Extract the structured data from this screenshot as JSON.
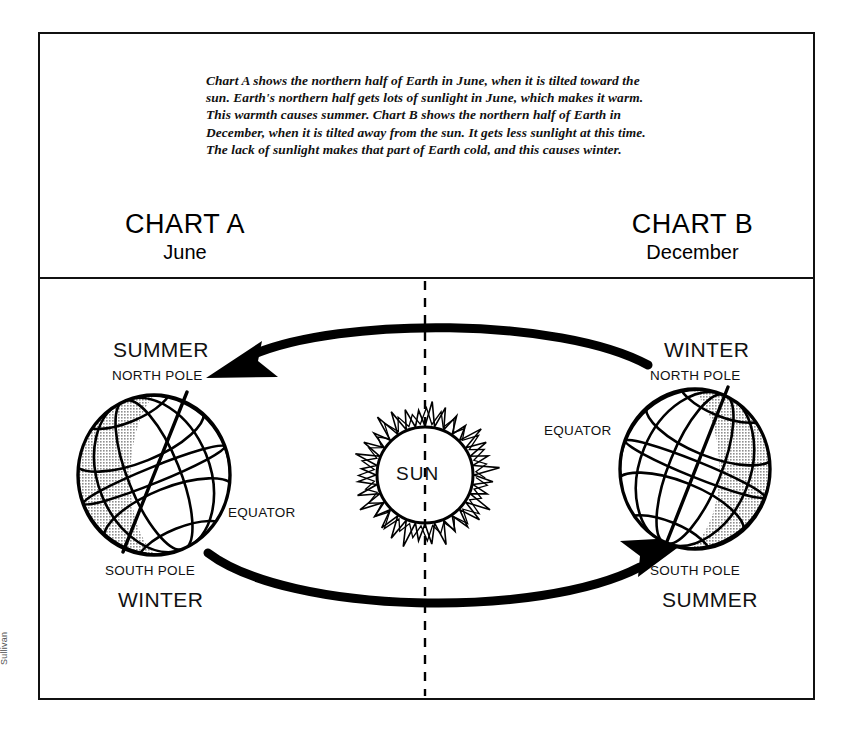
{
  "page": {
    "credit": "Sullivan"
  },
  "intro": {
    "text": "Chart A shows the northern half of Earth in June, when it is tilted toward the sun. Earth's northern half gets lots of sunlight in June, which makes it warm. This warmth causes summer. Chart B shows the northern half of Earth in December, when it is tilted away from the sun. It gets less sunlight at this time.  The lack of sunlight makes that part of Earth cold, and this causes winter."
  },
  "headings": {
    "chart_a": {
      "title": "CHART A",
      "subtitle": "June"
    },
    "chart_b": {
      "title": "CHART B",
      "subtitle": "December"
    }
  },
  "sun": {
    "label": "SUN"
  },
  "globe_a": {
    "season_top": "SUMMER",
    "north_pole": "NORTH POLE",
    "equator": "EQUATOR",
    "south_pole": "SOUTH POLE",
    "season_bottom": "WINTER"
  },
  "globe_b": {
    "season_top": "WINTER",
    "north_pole": "NORTH POLE",
    "equator": "EQUATOR",
    "south_pole": "SOUTH POLE",
    "season_bottom": "SUMMER"
  },
  "chart_data": {
    "type": "diagram",
    "center_body": "SUN",
    "orbit_direction": "counter-clockwise loop between the two Earth positions",
    "positions": [
      {
        "chart": "CHART A",
        "month": "June",
        "side": "left",
        "tilt": "north pole tilted toward the sun",
        "northern_hemisphere_season": "SUMMER",
        "southern_hemisphere_season": "WINTER",
        "shaded_side": "left (night / away from sun)",
        "sunlight": "northern half receives lots of sunlight"
      },
      {
        "chart": "CHART B",
        "month": "December",
        "side": "right",
        "tilt": "north pole tilted away from the sun",
        "northern_hemisphere_season": "WINTER",
        "southern_hemisphere_season": "SUMMER",
        "shaded_side": "right (night / away from sun)",
        "sunlight": "northern half receives less sunlight"
      }
    ],
    "labels_per_globe": [
      "NORTH POLE",
      "EQUATOR",
      "SOUTH POLE"
    ],
    "colors": {
      "ink": "#111111",
      "shade": "#9a9a9a",
      "background": "#ffffff"
    }
  }
}
